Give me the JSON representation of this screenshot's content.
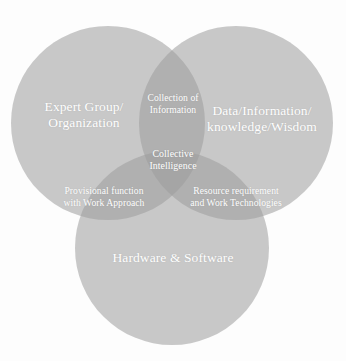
{
  "diagram": {
    "type": "venn",
    "set_count": 3,
    "background_color": "#fdfdfd",
    "label_color": "#ffffff",
    "base_circle_color": "#9a9a9a",
    "circles": [
      {
        "id": "expert-group",
        "label": "Expert Group/\nOrganization",
        "position": "left",
        "cx": 108,
        "cy": 123,
        "r": 97,
        "fill": "#9c9c9c",
        "opacity": 0.55
      },
      {
        "id": "data-information",
        "label": "Data/Information/\nknowledge/Wisdom",
        "position": "right",
        "cx": 236,
        "cy": 123,
        "r": 97,
        "fill": "#9c9c9c",
        "opacity": 0.55
      },
      {
        "id": "hardware-software",
        "label": "Hardware & Software",
        "position": "bottom",
        "cx": 172,
        "cy": 248,
        "r": 97,
        "fill": "#9c9c9c",
        "opacity": 0.55
      }
    ],
    "intersections": [
      {
        "id": "top-intersection",
        "label": "Collection of\nInformation",
        "sets": [
          "expert-group",
          "data-information"
        ]
      },
      {
        "id": "bottom-left-intersection",
        "label": "Provisional function\nwith Work Approach",
        "sets": [
          "expert-group",
          "hardware-software"
        ]
      },
      {
        "id": "bottom-right-intersection",
        "label": "Resource requirement\nand Work Technologies",
        "sets": [
          "data-information",
          "hardware-software"
        ]
      },
      {
        "id": "center-intersection",
        "label": "Collective\nIntelligence",
        "sets": [
          "expert-group",
          "data-information",
          "hardware-software"
        ]
      }
    ]
  }
}
